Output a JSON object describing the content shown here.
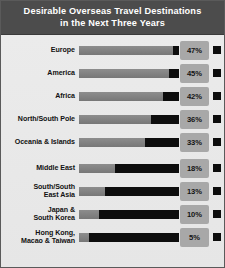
{
  "header": {
    "title_line_1": "Desirable Overseas Travel Destinations",
    "title_line_2": "in the Next Three Years",
    "background_color": "#4c4c4c",
    "text_color": "#ffffff"
  },
  "colors": {
    "panel_background": "#e9e9e9",
    "panel_border": "#5a5a5a",
    "bar_value": "#808080",
    "bar_remainder": "#0d0d0d",
    "percent_chip_background": "#a8a8a8",
    "percent_text": "#141414",
    "label_text": "#111111"
  },
  "chart_data": {
    "type": "bar",
    "title": "Desirable Overseas Travel Destinations in the Next Three Years",
    "xlabel": "",
    "ylabel": "",
    "orientation": "horizontal",
    "grid": false,
    "legend": "none",
    "xlim": [
      0,
      50
    ],
    "value_suffix": "%",
    "categories": [
      "Europe",
      "America",
      "Africa",
      "North/South Pole",
      "Oceania & Islands",
      "Middle East",
      "South/South\nEast Asia",
      "Japan &\nSouth Korea",
      "Hong Kong,\nMacao & Taiwan"
    ],
    "values": [
      47,
      45,
      42,
      36,
      33,
      18,
      13,
      10,
      5
    ],
    "labels": [
      "47%",
      "45%",
      "42%",
      "36%",
      "33%",
      "18%",
      "13%",
      "10%",
      "5%"
    ]
  },
  "rows": [
    {
      "label": "Europe",
      "value": 47,
      "display": "47%",
      "group_gap": false
    },
    {
      "label": "America",
      "value": 45,
      "display": "45%",
      "group_gap": false
    },
    {
      "label": "Africa",
      "value": 42,
      "display": "42%",
      "group_gap": false
    },
    {
      "label": "North/South Pole",
      "value": 36,
      "display": "36%",
      "group_gap": false
    },
    {
      "label": "Oceania & Islands",
      "value": 33,
      "display": "33%",
      "group_gap": true
    },
    {
      "label": "Middle East",
      "value": 18,
      "display": "18%",
      "group_gap": false
    },
    {
      "label": "South/South\nEast Asia",
      "value": 13,
      "display": "13%",
      "group_gap": false
    },
    {
      "label": "Japan &\nSouth Korea",
      "value": 10,
      "display": "10%",
      "group_gap": false
    },
    {
      "label": "Hong Kong,\nMacao & Taiwan",
      "value": 5,
      "display": "5%",
      "group_gap": false
    }
  ]
}
